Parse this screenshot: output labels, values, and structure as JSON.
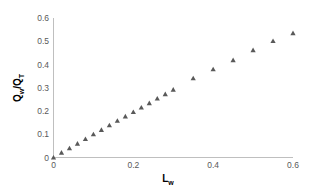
{
  "chart_data": {
    "type": "scatter",
    "title": "",
    "xlabel": "L_w",
    "ylabel": "Q_w/Q_T",
    "xlabel_main": "L",
    "xlabel_sub": "w",
    "ylabel_parts": {
      "q1": "Q",
      "s1": "w",
      "slash": "/",
      "q2": "Q",
      "s2": "T"
    },
    "xlim": [
      0,
      0.6
    ],
    "ylim": [
      0,
      0.6
    ],
    "xticks": [
      "0",
      "0.2",
      "0.4",
      "0.6"
    ],
    "yticks": [
      "0",
      "0.1",
      "0.2",
      "0.3",
      "0.4",
      "0.5",
      "0.6"
    ],
    "grid": false,
    "legend": null,
    "marker": "triangle",
    "marker_color": "#595959",
    "axis_color": "#bfbfbf",
    "series": [
      {
        "name": "data",
        "x": [
          0,
          0.02,
          0.04,
          0.06,
          0.08,
          0.1,
          0.12,
          0.14,
          0.16,
          0.18,
          0.2,
          0.22,
          0.24,
          0.26,
          0.28,
          0.3,
          0.35,
          0.4,
          0.45,
          0.5,
          0.55,
          0.6
        ],
        "y": [
          0,
          0.021,
          0.04,
          0.06,
          0.08,
          0.1,
          0.119,
          0.139,
          0.158,
          0.177,
          0.196,
          0.215,
          0.234,
          0.254,
          0.273,
          0.292,
          0.341,
          0.38,
          0.419,
          0.462,
          0.501,
          0.535
        ]
      }
    ]
  }
}
